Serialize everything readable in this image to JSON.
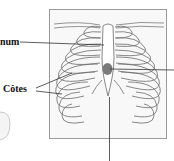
{
  "labels": {
    "sternum": "num",
    "ribs": "Côtes"
  },
  "colors": {
    "frame": "#9a9a9a",
    "frame_fill": "#f7f7f7",
    "rib_stroke": "#6b6b6b",
    "leader": "#333333",
    "marker": "#7a7a7a"
  },
  "diagram": {
    "structures": [
      "sternum",
      "ribs",
      "clavicles",
      "xiphoid process"
    ],
    "marker": "grey spot on sternum"
  }
}
